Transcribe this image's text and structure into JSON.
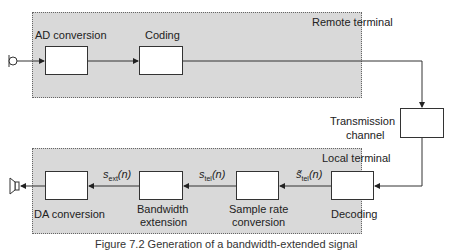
{
  "remote_terminal": {
    "label": "Remote terminal",
    "blocks": [
      {
        "id": "ad",
        "label": "AD conversion"
      },
      {
        "id": "coding",
        "label": "Coding"
      }
    ]
  },
  "channel": {
    "label_line1": "Transmission",
    "label_line2": "channel"
  },
  "local_terminal": {
    "label": "Local terminal",
    "blocks": [
      {
        "id": "decoding",
        "label": "Decoding"
      },
      {
        "id": "src",
        "label_line1": "Sample rate",
        "label_line2": "conversion"
      },
      {
        "id": "bwe",
        "label_line1": "Bandwidth",
        "label_line2": "extension"
      },
      {
        "id": "da",
        "label": "DA conversion"
      }
    ],
    "signals": [
      {
        "base": "s̃",
        "sub": "tel",
        "arg": "(n)"
      },
      {
        "base": "s",
        "sub": "tel",
        "arg": "(n)"
      },
      {
        "base": "s",
        "sub": "ext",
        "arg": "(n)"
      }
    ]
  },
  "caption": "Figure 7.2   Generation of a bandwidth-extended signal",
  "colors": {
    "terminal_fill": "#d9d9d9",
    "block_fill": "#ffffff",
    "line": "#333333"
  }
}
